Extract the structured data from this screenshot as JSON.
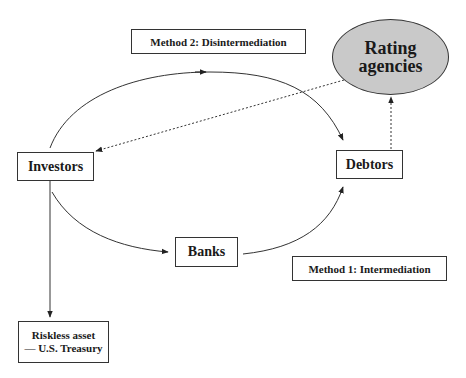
{
  "diagram": {
    "labels": {
      "method2": "Method 2: Disintermediation",
      "method1": "Method 1: Intermediation"
    },
    "nodes": {
      "rating_agencies": {
        "line1": "Rating",
        "line2": "agencies",
        "fill": "#c9c9c9"
      },
      "investors": "Investors",
      "debtors": "Debtors",
      "banks": "Banks",
      "riskless": {
        "line1": "Riskless asset",
        "line2": "— U.S. Treasury"
      }
    },
    "edges": [
      {
        "from": "Investors",
        "to": "Debtors",
        "style": "solid",
        "label": "Method 2: Disintermediation"
      },
      {
        "from": "Investors",
        "to": "Banks",
        "style": "solid"
      },
      {
        "from": "Banks",
        "to": "Debtors",
        "style": "solid",
        "label": "Method 1: Intermediation"
      },
      {
        "from": "Investors",
        "to": "Riskless asset — U.S. Treasury",
        "style": "solid"
      },
      {
        "from": "Debtors",
        "to": "Rating agencies",
        "style": "dotted"
      },
      {
        "from": "Rating agencies",
        "to": "Investors",
        "style": "dotted"
      }
    ]
  }
}
